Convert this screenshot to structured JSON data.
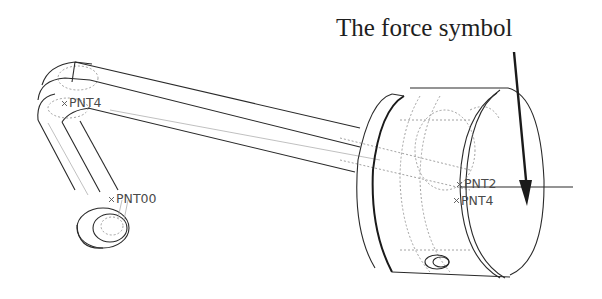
{
  "annotation": {
    "caption": "The force symbol",
    "arrow": {
      "from": [
        520,
        55
      ],
      "to": [
        530,
        205
      ],
      "color": "#1a1a1a"
    }
  },
  "points": [
    {
      "id": "pnt4_crank",
      "label": "PNT4",
      "x": 63,
      "y": 100
    },
    {
      "id": "pnt00",
      "label": "PNT00",
      "x": 110,
      "y": 195
    },
    {
      "id": "pnt2",
      "label": "PNT2",
      "x": 460,
      "y": 182
    },
    {
      "id": "pnt4_piston",
      "label": "PNT4",
      "x": 455,
      "y": 198
    }
  ],
  "force_line": {
    "from": [
      460,
      187
    ],
    "to": [
      573,
      187
    ]
  },
  "colors": {
    "line": "#2a2a2a",
    "hidden_line": "#8a8a8a",
    "text": "#1e1e1e",
    "label": "#4a4a4a",
    "background": "#ffffff"
  }
}
